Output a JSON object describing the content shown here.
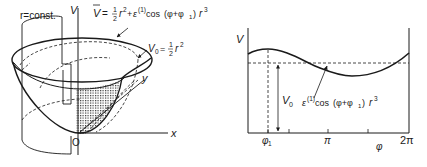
{
  "left_diagram": {
    "axis_labels": {
      "v": "V",
      "x": "x",
      "y": "y",
      "origin": "O"
    },
    "cylinder_label": "r=const.",
    "perturbed_potential": {
      "lhs": "V",
      "eq": "=",
      "frac_num": "1",
      "frac_den": "2",
      "r2": "r",
      "r2_exp": "2",
      "plus": "+",
      "eps": "ε",
      "eps_sup": "(1)",
      "cos": "cos",
      "arg": "(φ+φ",
      "arg_sub": "1",
      "arg_close": ")",
      "r3": "r",
      "r3_exp": "3"
    },
    "unperturbed_potential": {
      "lhs": "V",
      "lhs_sub": "0",
      "eq": "=",
      "frac_num": "1",
      "frac_den": "2",
      "r": "r",
      "r_exp": "2"
    }
  },
  "right_plot": {
    "y_axis_label": "V",
    "x_axis_label": "φ",
    "x_ticks": [
      {
        "label": "φ",
        "sub": "1"
      },
      {
        "label": "π"
      },
      {
        "label": "2π"
      }
    ],
    "v0_label": {
      "text": "V",
      "sub": "0"
    },
    "annotation": {
      "eps": "ε",
      "eps_sup": "(1)",
      "cos": "cos",
      "arg": "(φ+φ",
      "arg_sub": "1",
      "arg_close": ")",
      "r": "r",
      "r_exp": "3"
    }
  },
  "colors": {
    "ink": "#1a1a1a",
    "background": "#ffffff",
    "stipple": "#333333"
  }
}
